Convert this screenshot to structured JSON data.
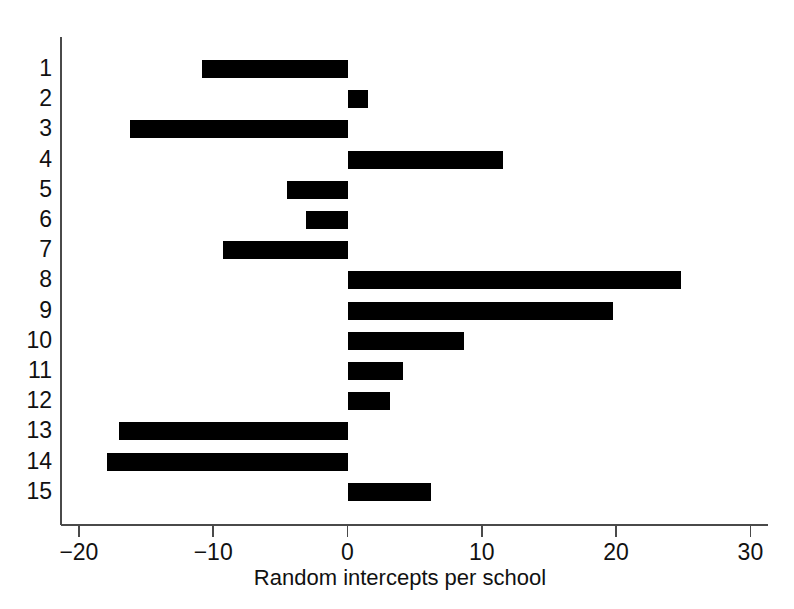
{
  "chart_data": {
    "type": "bar",
    "orientation": "horizontal",
    "title": "",
    "xlabel": "Random intercepts per school",
    "ylabel": "",
    "categories": [
      "1",
      "2",
      "3",
      "4",
      "5",
      "6",
      "7",
      "8",
      "9",
      "10",
      "11",
      "12",
      "13",
      "14",
      "15"
    ],
    "values": [
      -10.8,
      1.5,
      -16.2,
      11.6,
      -4.5,
      -3.1,
      -9.3,
      24.8,
      19.8,
      8.7,
      4.1,
      3.2,
      -17.0,
      -17.9,
      6.2
    ],
    "xticks": [
      -20,
      -10,
      0,
      10,
      20,
      30
    ],
    "xtick_labels": [
      "-20",
      "-10",
      "0",
      "10",
      "20",
      "30"
    ],
    "ytick_labels": [
      "1",
      "2",
      "3",
      "4",
      "5",
      "6",
      "7",
      "8",
      "9",
      "10",
      "11",
      "12",
      "13",
      "14",
      "15"
    ],
    "xlim": [
      -23.5,
      31.5
    ],
    "grid": false,
    "legend": null,
    "bar_color": "#000000",
    "axis_color": "#4a4a4a",
    "background_color": "#ffffff"
  }
}
